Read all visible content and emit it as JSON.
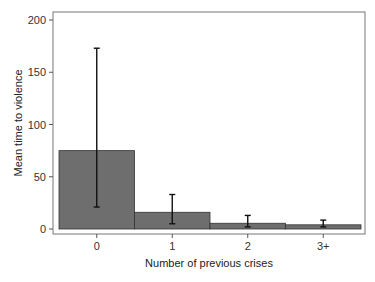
{
  "chart_data": {
    "type": "bar",
    "title": "",
    "xlabel": "Number of previous crises",
    "ylabel": "Mean time to violence",
    "categories": [
      "0",
      "1",
      "2",
      "3+"
    ],
    "values": [
      75,
      16,
      5.5,
      4
    ],
    "error_bars": {
      "lower": [
        21,
        5,
        2,
        2
      ],
      "upper": [
        173,
        33,
        13,
        8.5
      ]
    },
    "ylim": [
      0,
      200
    ],
    "yticks": [
      0,
      50,
      100,
      150,
      200
    ],
    "grid": false,
    "legend": null,
    "bar_color": "#6e6e6e",
    "frame_color": "#777777"
  }
}
